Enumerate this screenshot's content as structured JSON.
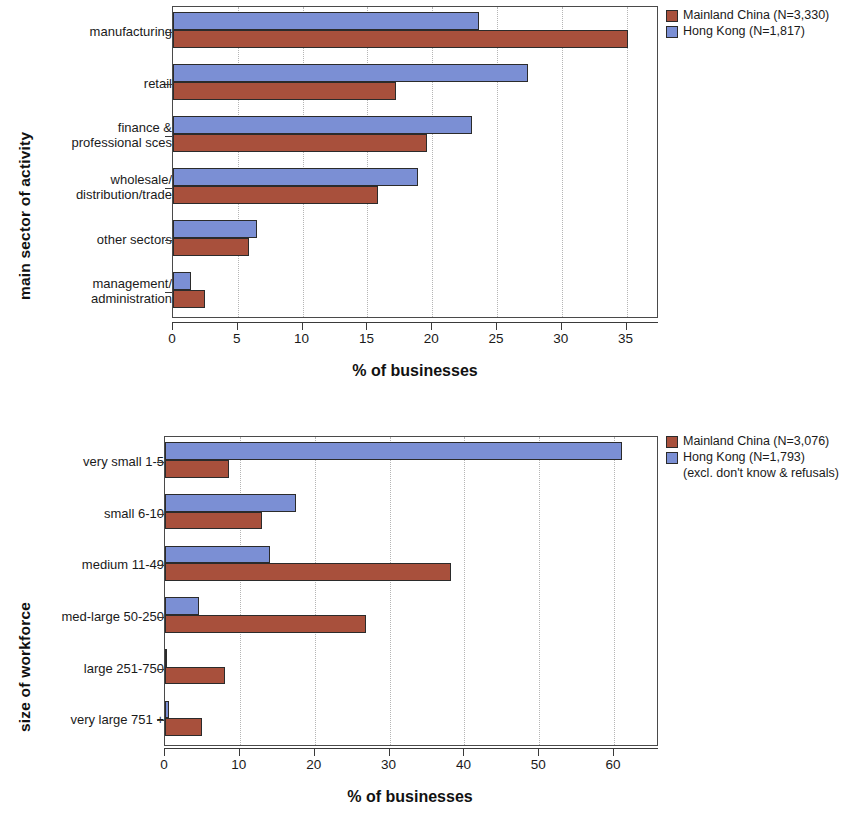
{
  "colors": {
    "mainland_china": "#a8503c",
    "hong_kong": "#7b8fd4",
    "frame": "#4a4a4a",
    "gridline": "#b5b5b5"
  },
  "chart_data": [
    {
      "type": "bar",
      "orientation": "horizontal",
      "title": "",
      "xlabel": "% of businesses",
      "ylabel": "main sector of activity",
      "categories": [
        "manufacturing",
        "retail",
        "finance &\nprofessional sces",
        "wholesale/\ndistribution/trade",
        "other sectors",
        "management/\nadministration"
      ],
      "series": [
        {
          "name": "Mainland China (N=3,330)",
          "color": "#a8503c",
          "values": [
            35.1,
            17.2,
            19.6,
            15.8,
            5.9,
            2.5
          ]
        },
        {
          "name": "Hong Kong (N=1,817)",
          "color": "#7b8fd4",
          "values": [
            23.6,
            27.4,
            23.1,
            18.9,
            6.5,
            1.4
          ]
        }
      ],
      "xlim": [
        0,
        37.5
      ],
      "xticks": [
        0,
        5,
        10,
        15,
        20,
        25,
        30,
        35
      ],
      "xtick_labels": [
        "0",
        "5",
        "10",
        "15",
        "20",
        "25",
        "30",
        "35"
      ],
      "grid": true,
      "grid_axis": "x",
      "legend_position": "right",
      "legend": [
        {
          "label": "Mainland China (N=3,330)",
          "color": "#a8503c"
        },
        {
          "label": "Hong Kong (N=1,817)",
          "color": "#7b8fd4"
        }
      ]
    },
    {
      "type": "bar",
      "orientation": "horizontal",
      "title": "",
      "xlabel": "% of businesses",
      "ylabel": "size of workforce",
      "categories": [
        "very small 1-5",
        "small 6-10",
        "medium 11-49",
        "med-large 50-250",
        "large 251-750",
        "very large 751 +"
      ],
      "series": [
        {
          "name": "Mainland China (N=3,076)",
          "color": "#a8503c",
          "values": [
            8.5,
            13.0,
            38.2,
            26.9,
            8.0,
            5.0
          ]
        },
        {
          "name": "Hong Kong (N=1,793)",
          "color": "#7b8fd4",
          "values": [
            61.0,
            17.5,
            14.0,
            4.6,
            0.2,
            0.5
          ]
        }
      ],
      "xlim": [
        0,
        66
      ],
      "xticks": [
        0,
        10,
        20,
        30,
        40,
        50,
        60
      ],
      "xtick_labels": [
        "0",
        "10",
        "20",
        "30",
        "40",
        "50",
        "60"
      ],
      "grid": true,
      "grid_axis": "x",
      "legend_position": "right",
      "legend": [
        {
          "label": "Mainland China (N=3,076)",
          "color": "#a8503c"
        },
        {
          "label": "Hong Kong (N=1,793)",
          "color": "#7b8fd4"
        }
      ],
      "legend_note": "(excl. don't know & refusals)"
    }
  ]
}
